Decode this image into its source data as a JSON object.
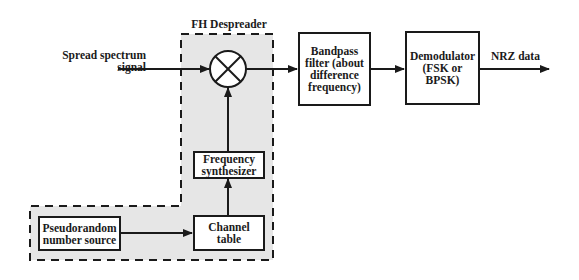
{
  "diagram": {
    "region_title": "FH Despreader",
    "input_label": "Spread spectrum\nsignal",
    "output_label": "NRZ data",
    "blocks": {
      "mixer": "multiplier",
      "frequency_synthesizer": "Frequency\nsynthesizer",
      "channel_table": "Channel\ntable",
      "pn_source": "Pseudorandom\nnumber source",
      "bandpass_filter": "Bandpass\nfilter (about\ndifference\nfrequency)",
      "demodulator": "Demodulator\n(FSK or\nBPSK)"
    },
    "colors": {
      "line": "#1a1a1a",
      "region_fill": "#e6e6e6",
      "background": "#ffffff"
    }
  }
}
